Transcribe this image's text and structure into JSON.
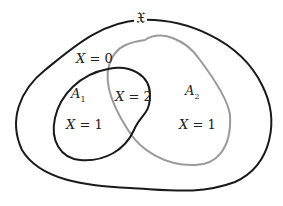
{
  "diagram": {
    "type": "venn",
    "universe_label": "𝔛",
    "sets": [
      {
        "name": "A",
        "subscript": "1",
        "stroke": "#1a1a1a"
      },
      {
        "name": "A",
        "subscript": "2",
        "stroke": "#9a9a9a"
      }
    ],
    "regions": {
      "outside": {
        "var": "X",
        "eq": " = 0"
      },
      "a1_only": {
        "var": "X",
        "eq": " = 1"
      },
      "intersection": {
        "var": "X",
        "eq": " = 2"
      },
      "a2_only": {
        "var": "X",
        "eq": " = 1"
      }
    },
    "colors": {
      "universe": "#1a1a1a",
      "a1": "#1a1a1a",
      "a2": "#9a9a9a"
    }
  }
}
